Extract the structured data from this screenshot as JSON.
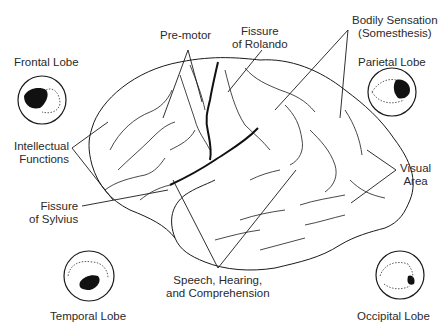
{
  "diagram": {
    "type": "brain-lateral-view",
    "labels": {
      "premotor": "Pre-motor",
      "fissure_rolando": [
        "Fissure",
        "of Rolando"
      ],
      "bodily_sensation": [
        "Bodily Sensation",
        "(Somesthesis)"
      ],
      "frontal_lobe": "Frontal Lobe",
      "parietal_lobe": "Parietal Lobe",
      "intellectual_functions": [
        "Intellectual",
        "Functions"
      ],
      "visual_area": [
        "Visual",
        "Area"
      ],
      "fissure_sylvius": [
        "Fissure",
        "of Sylvius"
      ],
      "speech": [
        "Speech, Hearing,",
        "and Comprehension"
      ],
      "temporal_lobe": "Temporal Lobe",
      "occipital_lobe": "Occipital Lobe"
    },
    "insets": [
      {
        "name": "frontal",
        "highlight": "front"
      },
      {
        "name": "parietal",
        "highlight": "upper-back"
      },
      {
        "name": "temporal",
        "highlight": "lower-middle"
      },
      {
        "name": "occipital",
        "highlight": "back"
      }
    ],
    "colors": {
      "ink": "#1a1a1a",
      "text": "#2a2a2a",
      "background": "#ffffff"
    }
  }
}
